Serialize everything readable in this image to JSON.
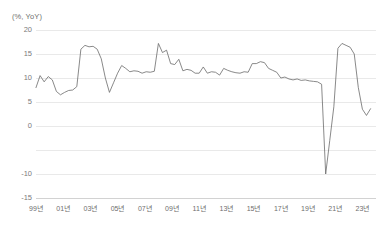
{
  "chart_data": {
    "type": "line",
    "title": "",
    "unit_label": "(%, YoY)",
    "xlabel": "",
    "ylabel": "",
    "ylim": [
      -15,
      20
    ],
    "yticks": [
      20,
      15,
      10,
      5,
      0,
      -5,
      -10,
      -15
    ],
    "ytick_labels": [
      "20",
      "15",
      "10",
      "5",
      "0",
      "",
      "-10",
      "-15"
    ],
    "grid": true,
    "legend": "none",
    "xtick_labels": [
      "99년",
      "01년",
      "03년",
      "05년",
      "07년",
      "09년",
      "11년",
      "13년",
      "15년",
      "17년",
      "19년",
      "21년",
      "23년"
    ],
    "xtick_years": [
      1999,
      2001,
      2003,
      2005,
      2007,
      2009,
      2011,
      2013,
      2015,
      2017,
      2019,
      2021,
      2023
    ],
    "xlim": [
      1999,
      2024
    ],
    "line_color": "#6b6b6b",
    "grid_color": "#e9e9e9",
    "series": [
      {
        "name": "YoY growth",
        "x": [
          1999.0,
          1999.3,
          1999.6,
          1999.9,
          2000.2,
          2000.5,
          2000.8,
          2001.1,
          2001.4,
          2001.7,
          2002.0,
          2002.3,
          2002.6,
          2002.9,
          2003.2,
          2003.5,
          2003.8,
          2004.1,
          2004.4,
          2004.7,
          2005.0,
          2005.3,
          2005.6,
          2005.9,
          2006.2,
          2006.5,
          2006.8,
          2007.1,
          2007.4,
          2007.7,
          2008.0,
          2008.3,
          2008.6,
          2008.9,
          2009.2,
          2009.5,
          2009.8,
          2010.1,
          2010.4,
          2010.7,
          2011.0,
          2011.3,
          2011.6,
          2011.9,
          2012.2,
          2012.5,
          2012.8,
          2013.1,
          2013.4,
          2013.7,
          2014.0,
          2014.3,
          2014.6,
          2014.9,
          2015.2,
          2015.5,
          2015.8,
          2016.1,
          2016.4,
          2016.7,
          2017.0,
          2017.3,
          2017.6,
          2017.9,
          2018.2,
          2018.5,
          2018.8,
          2019.1,
          2019.4,
          2019.7,
          2020.0,
          2020.3,
          2020.6,
          2020.9,
          2021.2,
          2021.5,
          2021.8,
          2022.1,
          2022.4,
          2022.7,
          2023.0,
          2023.3,
          2023.6
        ],
        "values": [
          8.0,
          10.5,
          9.2,
          10.3,
          9.6,
          7.2,
          6.5,
          7.0,
          7.4,
          7.5,
          8.2,
          16.0,
          16.8,
          16.5,
          16.6,
          16.0,
          14.0,
          10.0,
          7.0,
          9.0,
          11.0,
          12.6,
          12.0,
          11.3,
          11.5,
          11.4,
          11.0,
          11.3,
          11.2,
          11.4,
          17.2,
          15.3,
          15.8,
          13.0,
          12.8,
          13.9,
          11.5,
          11.8,
          11.6,
          11.0,
          11.0,
          12.3,
          11.0,
          11.3,
          11.2,
          10.6,
          12.0,
          11.6,
          11.3,
          11.1,
          11.0,
          11.3,
          11.2,
          13.0,
          13.0,
          13.4,
          13.2,
          12.0,
          11.6,
          11.2,
          10.0,
          10.2,
          9.8,
          9.6,
          9.8,
          9.5,
          9.6,
          9.4,
          9.3,
          9.2,
          8.7,
          -10.0,
          -3.0,
          4.0,
          16.2,
          17.2,
          16.8,
          16.4,
          15.0,
          8.0,
          3.5,
          2.2,
          3.6
        ]
      }
    ]
  },
  "axis": {
    "unit_label": "(%, YoY)"
  },
  "caption": {
    "text": ""
  }
}
